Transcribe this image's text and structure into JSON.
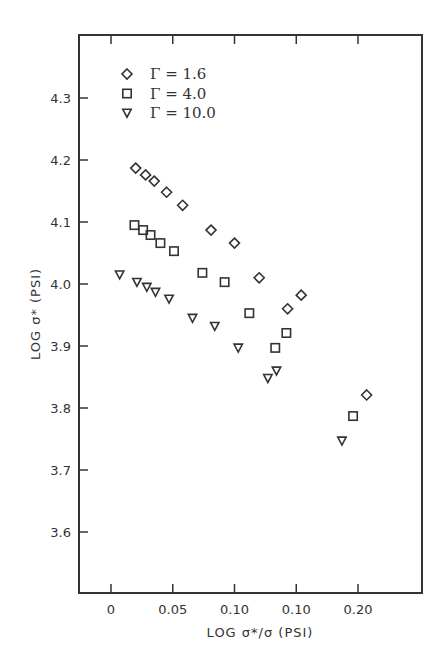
{
  "chart_data": {
    "type": "scatter",
    "title": "",
    "xlabel": "LOG σ*/σ (PSI)",
    "ylabel": "LOG σ* (PSI)",
    "x_ticks": [
      {
        "value": 0,
        "label": "0"
      },
      {
        "value": 0.05,
        "label": "0.05"
      },
      {
        "value": 0.1,
        "label": "0.10"
      },
      {
        "value": 0.15,
        "label": "0.10"
      },
      {
        "value": 0.2,
        "label": "0.20"
      }
    ],
    "y_ticks": [
      {
        "value": 3.6,
        "label": "3.6"
      },
      {
        "value": 3.7,
        "label": "3.7"
      },
      {
        "value": 3.8,
        "label": "3.8"
      },
      {
        "value": 3.9,
        "label": "3.9"
      },
      {
        "value": 4.0,
        "label": "4.0"
      },
      {
        "value": 4.1,
        "label": "4.1"
      },
      {
        "value": 4.2,
        "label": "4.2"
      },
      {
        "value": 4.3,
        "label": "4.3"
      }
    ],
    "xlim": [
      -0.026,
      0.252
    ],
    "ylim": [
      3.52,
      4.4
    ],
    "grid": false,
    "legend_position": "upper-left inside",
    "series": [
      {
        "name": "Γ = 1.6",
        "marker": "diamond",
        "points": [
          [
            0.02,
            4.187
          ],
          [
            0.028,
            4.176
          ],
          [
            0.035,
            4.166
          ],
          [
            0.045,
            4.148
          ],
          [
            0.058,
            4.127
          ],
          [
            0.081,
            4.087
          ],
          [
            0.1,
            4.066
          ],
          [
            0.12,
            4.01
          ],
          [
            0.143,
            3.96
          ],
          [
            0.154,
            3.982
          ],
          [
            0.207,
            3.821
          ]
        ]
      },
      {
        "name": "Γ = 4.0",
        "marker": "square",
        "points": [
          [
            0.019,
            4.095
          ],
          [
            0.026,
            4.087
          ],
          [
            0.032,
            4.079
          ],
          [
            0.04,
            4.066
          ],
          [
            0.051,
            4.053
          ],
          [
            0.074,
            4.018
          ],
          [
            0.092,
            4.003
          ],
          [
            0.112,
            3.953
          ],
          [
            0.142,
            3.921
          ],
          [
            0.133,
            3.897
          ],
          [
            0.196,
            3.787
          ]
        ]
      },
      {
        "name": "Γ = 10.0",
        "marker": "triangle-down",
        "points": [
          [
            0.007,
            4.015
          ],
          [
            0.021,
            4.003
          ],
          [
            0.029,
            3.995
          ],
          [
            0.036,
            3.987
          ],
          [
            0.047,
            3.976
          ],
          [
            0.066,
            3.945
          ],
          [
            0.084,
            3.932
          ],
          [
            0.103,
            3.897
          ],
          [
            0.127,
            3.848
          ],
          [
            0.134,
            3.86
          ],
          [
            0.187,
            3.747
          ]
        ]
      }
    ]
  },
  "legend": {
    "items": [
      {
        "label": "Γ = 1.6",
        "marker": "diamond"
      },
      {
        "label": "Γ = 4.0",
        "marker": "square"
      },
      {
        "label": "Γ = 10.0",
        "marker": "triangle-down"
      }
    ]
  },
  "axes": {
    "x_title": "LOG σ*/σ (PSI)",
    "y_title": "LOG σ* (PSI)"
  },
  "colors": {
    "ink": "#333333",
    "background": "#ffffff"
  }
}
